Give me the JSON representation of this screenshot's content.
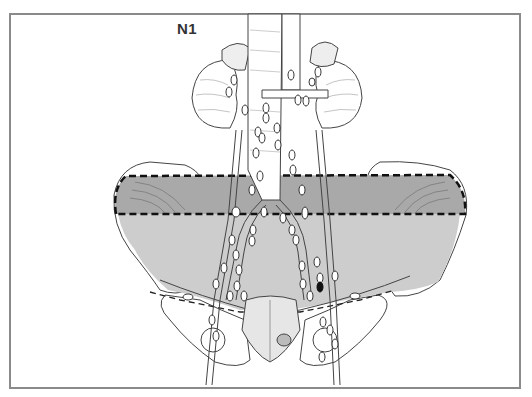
{
  "figure": {
    "label": "N1",
    "colors": {
      "frame": "#8a8a8a",
      "upper_zone": "#a9a9a9",
      "lower_zone": "#cdcdcd",
      "line": "#333333",
      "node_fill": "#ffffff",
      "positive_node": "#111111"
    },
    "zones": [
      {
        "name": "upper-zone",
        "shade": "dark",
        "bordered": "dashed"
      },
      {
        "name": "lower-pelvic-zone",
        "shade": "light"
      }
    ]
  }
}
